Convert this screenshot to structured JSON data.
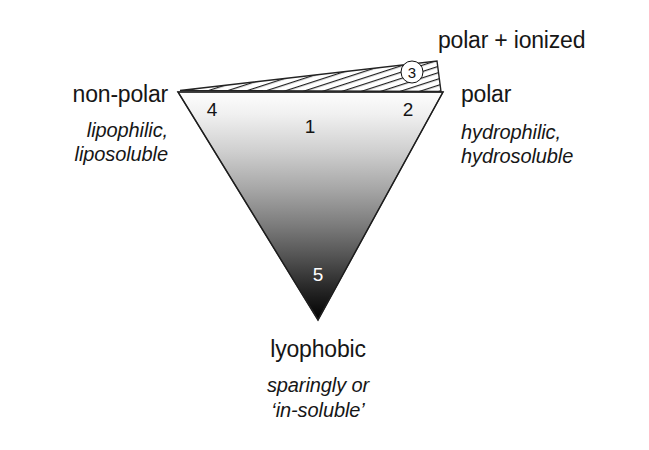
{
  "figure": {
    "background_color": "#ffffff",
    "ink_color": "#161616"
  },
  "labels": {
    "left_main": "non-polar",
    "left_sub_line1": "lipophilic,",
    "left_sub_line2": "liposoluble",
    "right_main": "polar",
    "right_sub_line1": "hydrophilic,",
    "right_sub_line2": "hydrosoluble",
    "top_right_main": "polar + ionized",
    "bottom_main": "lyophobic",
    "bottom_sub_line1": "sparingly or",
    "bottom_sub_line2": "‘in-soluble’"
  },
  "zones": [
    {
      "id": "zone-1",
      "number": "1",
      "x": 310,
      "y": 127,
      "tone": "dark"
    },
    {
      "id": "zone-2",
      "number": "2",
      "x": 408,
      "y": 110,
      "tone": "dark"
    },
    {
      "id": "zone-4",
      "number": "4",
      "x": 212,
      "y": 110,
      "tone": "dark"
    },
    {
      "id": "zone-5",
      "number": "5",
      "x": 318,
      "y": 275,
      "tone": "light"
    }
  ],
  "circled_zone": {
    "id": "zone-3",
    "number": "3",
    "x": 412,
    "y": 72
  },
  "geometry": {
    "main_triangle": {
      "left_vertex": [
        178,
        92
      ],
      "right_vertex": [
        443,
        92
      ],
      "bottom_vertex": [
        318,
        320
      ],
      "fill": "vertical gradient white to black",
      "gradient_top_color": "#fdfdfd",
      "gradient_mid_color": "#808080",
      "gradient_bottom_color": "#000000",
      "stroke": "#2a2a2a"
    },
    "hatched_sliver": {
      "left_vertex": [
        180,
        90
      ],
      "right_top_vertex": [
        437,
        61
      ],
      "right_bottom_vertex": [
        441,
        91
      ],
      "fill": "diagonal line hatching",
      "hatch_color": "#1f1f1f",
      "stroke": "#2a2a2a"
    }
  }
}
